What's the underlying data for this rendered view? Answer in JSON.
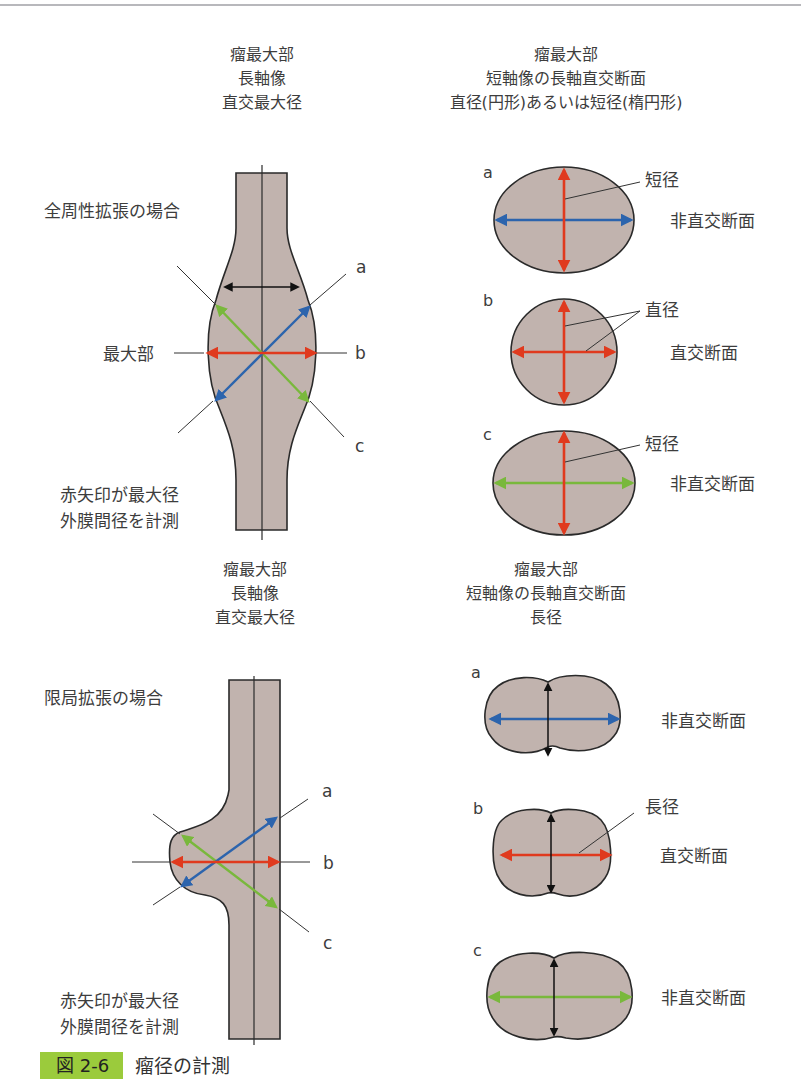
{
  "colors": {
    "vessel_fill": "#c1b3ae",
    "outline": "#2a2a2a",
    "red_arrow": "#e03a1e",
    "blue_arrow": "#2c64ad",
    "green_arrow": "#79b83c",
    "caption_badge": "#9bcb3c"
  },
  "upper": {
    "long_axis_header": [
      "瘤最大部",
      "長軸像",
      "直交最大径"
    ],
    "short_axis_header": [
      "瘤最大部",
      "短軸像の長軸直交断面",
      "直径(円形)あるいは短径(楕円形)"
    ],
    "case_label": "全周性拡張の場合",
    "max_part_label": "最大部",
    "note_lines": [
      "赤矢印が最大径",
      "外膜間径を計測"
    ],
    "line_labels": {
      "a": "a",
      "b": "b",
      "c": "c"
    },
    "sections": [
      {
        "letter": "a",
        "callout": "短径",
        "type_label": "非直交断面",
        "shape": "ellipse",
        "horizontal_arrow": "blue",
        "vertical_arrow": "red"
      },
      {
        "letter": "b",
        "callout": "直径",
        "type_label": "直交断面",
        "shape": "circle",
        "horizontal_arrow": "red",
        "vertical_arrow": "red"
      },
      {
        "letter": "c",
        "callout": "短径",
        "type_label": "非直交断面",
        "shape": "ellipse",
        "horizontal_arrow": "green",
        "vertical_arrow": "red"
      }
    ]
  },
  "lower": {
    "long_axis_header": [
      "瘤最大部",
      "長軸像",
      "直交最大径"
    ],
    "short_axis_header": [
      "瘤最大部",
      "短軸像の長軸直交断面",
      "長径"
    ],
    "case_label": "限局拡張の場合",
    "note_lines": [
      "赤矢印が最大径",
      "外膜間径を計測"
    ],
    "line_labels": {
      "a": "a",
      "b": "b",
      "c": "c"
    },
    "sections": [
      {
        "letter": "a",
        "callout": "",
        "type_label": "非直交断面",
        "shape": "bilobed",
        "horizontal_arrow": "blue",
        "vertical_arrow": "black"
      },
      {
        "letter": "b",
        "callout": "長径",
        "type_label": "直交断面",
        "shape": "bilobed",
        "horizontal_arrow": "red",
        "vertical_arrow": "black"
      },
      {
        "letter": "c",
        "callout": "",
        "type_label": "非直交断面",
        "shape": "bilobed",
        "horizontal_arrow": "green",
        "vertical_arrow": "black"
      }
    ]
  },
  "caption": {
    "figure_number": "図 2-6",
    "title": "瘤径の計測"
  }
}
